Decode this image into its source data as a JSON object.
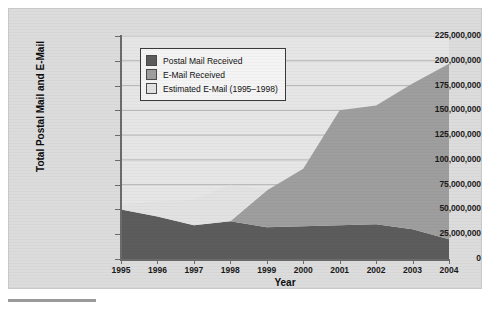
{
  "chart_data": {
    "type": "area",
    "stacked": true,
    "title": "",
    "xlabel": "Year",
    "ylabel": "Total Postal Mail and E-Mail",
    "x": [
      1995,
      1996,
      1997,
      1998,
      1999,
      2000,
      2001,
      2002,
      2003,
      2004
    ],
    "categories": [
      "1995",
      "1996",
      "1997",
      "1998",
      "1999",
      "2000",
      "2001",
      "2002",
      "2003",
      "2004"
    ],
    "xlim": [
      1995,
      2004
    ],
    "ylim": [
      0,
      225000000
    ],
    "ytick_values": [
      0,
      25000000,
      50000000,
      75000000,
      100000000,
      125000000,
      150000000,
      175000000,
      200000000,
      225000000
    ],
    "ytick_labels": [
      "0",
      "25,000,000",
      "50,000,000",
      "75,000,000",
      "100,000,000",
      "125,000,000",
      "150,000,000",
      "175,000,000",
      "200,000,000",
      "225,000,000"
    ],
    "grid": true,
    "grid_axis": "y",
    "legend_position": "upper left inside",
    "series": [
      {
        "name": "Postal Mail Received",
        "color": "#5c5c5c",
        "values": [
          50000000,
          43000000,
          34000000,
          38000000,
          32000000,
          33000000,
          34000000,
          35000000,
          30000000,
          20000000
        ]
      },
      {
        "name": "E-Mail Received",
        "color": "#9e9e9e",
        "values": [
          0,
          0,
          0,
          0,
          37000000,
          58000000,
          116000000,
          120000000,
          147000000,
          177000000
        ]
      },
      {
        "name": "Estimated E-Mail (1995–1998)",
        "color": "#e2e2e2",
        "values": [
          5000000,
          15000000,
          26000000,
          37000000,
          0,
          0,
          0,
          0,
          0,
          0
        ]
      }
    ],
    "totals": [
      55000000,
      58000000,
      60000000,
      75000000,
      69000000,
      91000000,
      150000000,
      155000000,
      177000000,
      197000000
    ],
    "annotations": []
  },
  "legend": {
    "items": [
      {
        "label": "Postal Mail Received",
        "color": "#5c5c5c"
      },
      {
        "label": "E-Mail Received",
        "color": "#9e9e9e"
      },
      {
        "label": "Estimated E-Mail (1995–1998)",
        "color": "#e2e2e2"
      }
    ]
  },
  "axes": {
    "y_title": "Total Postal Mail and E-Mail",
    "x_title": "Year"
  },
  "colors": {
    "postal": "#5c5c5c",
    "email": "#9e9e9e",
    "estimated": "#e2e2e2",
    "plot_background": "#e6e6e6",
    "panel_background": "#dcdcdc",
    "axis": "#6b6b6b",
    "grid": "#b4b4b4"
  }
}
